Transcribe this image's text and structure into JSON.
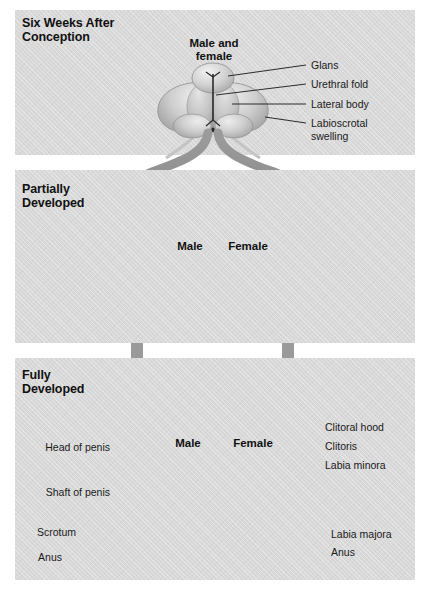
{
  "figure": {
    "background_color": "#ffffff",
    "panel_color": "#d8d8d8",
    "arrow_color": "#8c8c8c",
    "leader_color": "#2b2b2b"
  },
  "panels": [
    {
      "id": "six-weeks",
      "stage_label": "Six Weeks After\nConception",
      "figures": [
        {
          "id": "male-and-female",
          "caption": "Male and\nfemale"
        }
      ],
      "labels": [
        {
          "id": "glans",
          "text": "Glans"
        },
        {
          "id": "urethral-fold",
          "text": "Urethral fold"
        },
        {
          "id": "lateral-body",
          "text": "Lateral body"
        },
        {
          "id": "labioscrotal-swelling",
          "text": "Labioscrotal\nswelling"
        }
      ]
    },
    {
      "id": "partially-developed",
      "stage_label": "Partially\nDeveloped",
      "figures": [
        {
          "id": "male",
          "caption": "Male"
        },
        {
          "id": "female",
          "caption": "Female"
        }
      ],
      "labels": []
    },
    {
      "id": "fully-developed",
      "stage_label": "Fully\nDeveloped",
      "figures": [
        {
          "id": "male",
          "caption": "Male"
        },
        {
          "id": "female",
          "caption": "Female"
        }
      ],
      "labels": [
        {
          "id": "head-of-penis",
          "text": "Head of penis",
          "side": "left"
        },
        {
          "id": "shaft-of-penis",
          "text": "Shaft of penis",
          "side": "left"
        },
        {
          "id": "scrotum",
          "text": "Scrotum",
          "side": "left"
        },
        {
          "id": "anus-male",
          "text": "Anus",
          "side": "left"
        },
        {
          "id": "clitoral-hood",
          "text": "Clitoral hood",
          "side": "right"
        },
        {
          "id": "clitoris",
          "text": "Clitoris",
          "side": "right"
        },
        {
          "id": "labia-minora",
          "text": "Labia minora",
          "side": "right"
        },
        {
          "id": "labia-majora",
          "text": "Labia majora",
          "side": "right"
        },
        {
          "id": "anus-female",
          "text": "Anus",
          "side": "right"
        }
      ]
    }
  ]
}
